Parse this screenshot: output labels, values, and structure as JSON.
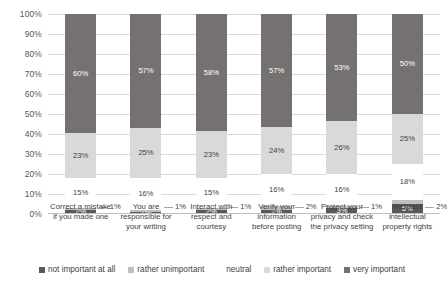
{
  "chart_data": {
    "type": "bar",
    "subtype": "stacked-100-percent",
    "title": "",
    "subtitle": "",
    "xlabel": "",
    "ylabel": "",
    "ylim": [
      0,
      100
    ],
    "y_tick_labels": [
      "100%",
      "90%",
      "80%",
      "70%",
      "60%",
      "50%",
      "40%",
      "30%",
      "20%",
      "10%",
      "0%"
    ],
    "grid": true,
    "legend_position": "bottom",
    "categories": [
      "Correct a mistake if you made one",
      "You are responsible for your writing",
      "Interact with respect and courtesy",
      "Verify your information before posting",
      "Protect your privacy and check the privacy setting",
      "Respect intellectual property rights"
    ],
    "category_lines": [
      [
        "Correct a mistake",
        "if you made one"
      ],
      [
        "You are",
        "responsible for",
        "your writing"
      ],
      [
        "Interact with",
        "respect and",
        "courtesy"
      ],
      [
        "Verify your",
        "information",
        "before posting"
      ],
      [
        "Protect your",
        "privacy and check",
        "the privacy setting"
      ],
      [
        "Respect",
        "intellectual",
        "property rights"
      ]
    ],
    "series": [
      {
        "name": "not important at all",
        "color": "#595959",
        "values": [
          2,
          1,
          2,
          2,
          3,
          5
        ],
        "labels": [
          "2%",
          "1%",
          "2%",
          "2%",
          "3%",
          "5%"
        ]
      },
      {
        "name": "rather unimportant",
        "color": "#bfbfbf",
        "values": [
          1,
          1,
          1,
          2,
          1,
          2
        ],
        "labels": [
          "1%",
          "1%",
          "1%",
          "2%",
          "1%",
          "2%"
        ]
      },
      {
        "name": "neutral",
        "color": "#ffffff",
        "values": [
          15,
          16,
          15,
          16,
          16,
          18
        ],
        "labels": [
          "15%",
          "16%",
          "15%",
          "16%",
          "16%",
          "18%"
        ]
      },
      {
        "name": "rather important",
        "color": "#d9d9d9",
        "values": [
          23,
          25,
          23,
          24,
          26,
          25
        ],
        "labels": [
          "23%",
          "25%",
          "23%",
          "24%",
          "26%",
          "25%"
        ]
      },
      {
        "name": "very important",
        "color": "#767171",
        "values": [
          60,
          57,
          58,
          57,
          53,
          50
        ],
        "labels": [
          "60%",
          "57%",
          "58%",
          "57%",
          "53%",
          "50%"
        ]
      }
    ]
  }
}
